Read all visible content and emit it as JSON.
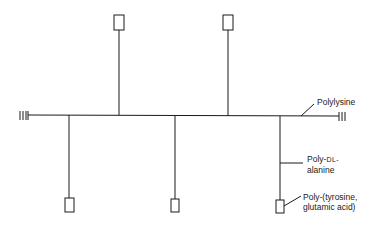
{
  "diagram": {
    "type": "graft copolymer schematic",
    "backbone": {
      "label": "Polylysine"
    },
    "side_chain": {
      "label_line1_prefix": "Poly-",
      "label_line1_sc": "DL-",
      "label_line2": "alanine"
    },
    "end_group": {
      "label_line1": "Poly-(tyrosine,",
      "label_line2": "glutamic acid)"
    },
    "continuation_marks": "|||",
    "branches_up": 2,
    "branches_down": 3,
    "line_color": "#1a1a1a"
  }
}
